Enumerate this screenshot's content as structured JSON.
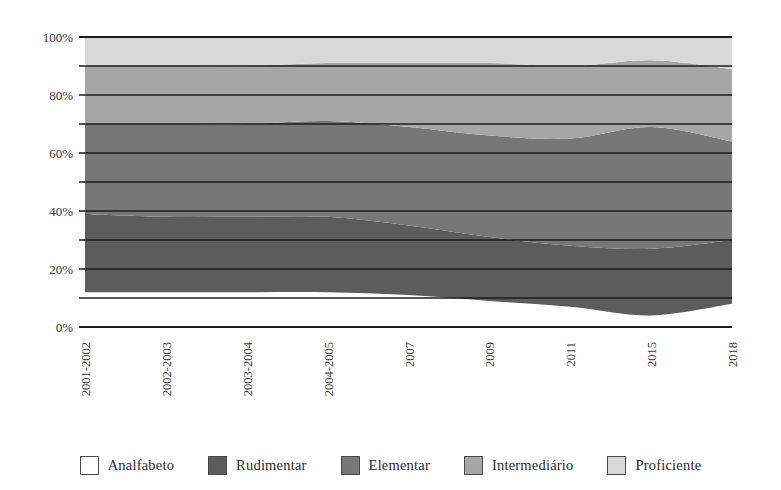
{
  "chart_data": {
    "type": "area",
    "stacked": true,
    "normalized": true,
    "title": "",
    "subtitle": "",
    "xlabel": "",
    "ylabel": "",
    "grid": true,
    "grid_step": 10,
    "ylim": [
      0,
      100
    ],
    "ytick_labels": [
      "0%",
      "20%",
      "40%",
      "60%",
      "80%",
      "100%"
    ],
    "yticks": [
      0,
      20,
      40,
      60,
      80,
      100
    ],
    "legend_position": "bottom",
    "categories": [
      "2001-2002",
      "2002-2003",
      "2003-2004",
      "2004-2005",
      "2007",
      "2009",
      "2011",
      "2015",
      "2018"
    ],
    "series": [
      {
        "name": "Analfabeto",
        "color": "#ffffff",
        "values": [
          12,
          12,
          12,
          12,
          11,
          9,
          7,
          4,
          8
        ]
      },
      {
        "name": "Rudimentar",
        "color": "#5c5c5c",
        "values": [
          27,
          26,
          26,
          26,
          24,
          22,
          21,
          23,
          22
        ]
      },
      {
        "name": "Elementar",
        "color": "#777777",
        "values": [
          31,
          32,
          32,
          33,
          34,
          35,
          37,
          42,
          34
        ]
      },
      {
        "name": "Intermediário",
        "color": "#a6a6a6",
        "values": [
          20,
          20,
          20,
          20,
          22,
          25,
          25,
          23,
          25
        ]
      },
      {
        "name": "Proficiente",
        "color": "#d8d8d8",
        "values": [
          10,
          10,
          10,
          9,
          9,
          9,
          10,
          8,
          11
        ]
      }
    ]
  },
  "legend": {
    "items": [
      {
        "label": "Analfabeto",
        "color": "#ffffff"
      },
      {
        "label": "Rudimentar",
        "color": "#5c5c5c"
      },
      {
        "label": "Elementar",
        "color": "#777777"
      },
      {
        "label": "Intermediário",
        "color": "#a6a6a6"
      },
      {
        "label": "Proficiente",
        "color": "#d8d8d8"
      }
    ]
  },
  "axis": {
    "line_color": "#1c1c1c",
    "grid_color": "#1c1c1c"
  }
}
